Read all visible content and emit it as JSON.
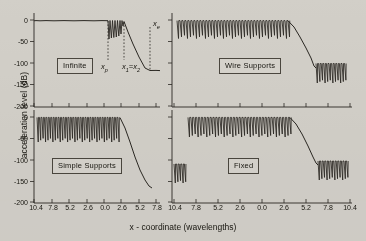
{
  "figure": {
    "xlabel": "x - coordinate (wavelengths)",
    "ylabel": "acceleration level (dB)"
  },
  "axes": {
    "ytick_labels": [
      "0",
      "-50",
      "-100",
      "-150",
      "-200"
    ],
    "ytick_values": [
      0,
      -50,
      -100,
      -150,
      -200
    ],
    "xtick_labels_left": [
      "10.4",
      "7.8",
      "5.2",
      "2.6",
      "0.0",
      "2.6",
      "5.2",
      "7.8"
    ],
    "xtick_labels_right": [
      "10.4",
      "7.8",
      "5.2",
      "2.6",
      "0.0",
      "2.6",
      "5.2",
      "7.8",
      "10.4"
    ],
    "xtick_values": [
      -10.4,
      -7.8,
      -5.2,
      -2.6,
      0.0,
      2.6,
      5.2,
      7.8,
      10.4
    ]
  },
  "panels": {
    "top_left": {
      "label": "Infinite"
    },
    "top_right": {
      "label": "Wire Supports"
    },
    "bottom_left": {
      "label": "Simple Supports"
    },
    "bottom_right": {
      "label": "Fixed"
    }
  },
  "annotations": {
    "xp": {
      "base": "x",
      "sub": "p"
    },
    "x1x2": {
      "base": "x",
      "sub": "1",
      "eq": "=",
      "base2": "x",
      "sub2": "2"
    },
    "xe": {
      "base": "x",
      "sub": "e"
    }
  },
  "chart_data": {
    "type": "line",
    "title": "",
    "xlabel": "x - coordinate (wavelengths)",
    "ylabel": "acceleration level (dB)",
    "xlim": [
      -11.7,
      11.7
    ],
    "ylim": [
      -210,
      10
    ],
    "grid": false,
    "legend": "none",
    "panel_layout": "2x2",
    "panels": [
      {
        "name": "Infinite",
        "position": "top-left",
        "description": "Flat plateau near 0 dB from x=-11.7 to x=1.6; short burst of narrow oscillation spikes between x=1.6 and x=3.0 reaching down to about -45 dB; steep linear roll-off from 0 dB at x=3.0 to -115 dB at x=5.5; flat tail at about -115 dB out to x=11.7.",
        "plateau_level_db": -2,
        "rolloff_start_x": 3.0,
        "rolloff_end_x": 5.5,
        "tail_level_db": -115,
        "annotations": [
          {
            "label": "x_p",
            "x": 1.6,
            "type": "vertical-dashed"
          },
          {
            "label": "x_1=x_2",
            "x": 3.0,
            "type": "vertical-dotted"
          },
          {
            "label": "x_e",
            "x": 5.5,
            "type": "vertical-dashed"
          }
        ]
      },
      {
        "name": "Wire Supports",
        "position": "top-right",
        "description": "Dense periodic spike train between 0 and about -40 dB across x=-10.6 to x=2.6; steep roll-off from x=2.6 to x=5.2 down to about -105 dB; second dense spike train between -100 and -160 dB from x=5.2 to x=11.0.",
        "upper_train_range_db": [
          -40,
          0
        ],
        "upper_train_x": [
          -10.6,
          2.6
        ],
        "rolloff_x": [
          2.6,
          5.2
        ],
        "lower_train_range_db": [
          -160,
          -100
        ],
        "lower_train_x": [
          5.2,
          11.0
        ]
      },
      {
        "name": "Simple Supports",
        "position": "bottom-left",
        "description": "Dense periodic spike train between 0 and about -60 dB across x=-11.0 to x=2.6; steep roll-off from x=2.6 to x=5.6 down to about -150 dB; sparse low-level residual near -150 to -175 dB beyond x=5.6.",
        "upper_train_range_db": [
          -60,
          0
        ],
        "upper_train_x": [
          -11.0,
          2.6
        ],
        "rolloff_x": [
          2.6,
          5.6
        ],
        "tail_level_db": -155
      },
      {
        "name": "Fixed",
        "position": "bottom-right",
        "description": "Short spike train at left edge between -110 and -150 dB; dense periodic spike train between 0 and about -45 dB from x=-10.0 to x=2.6; steep roll-off from x=2.6 to x=5.3 down to about -105 dB; dense spike train between -100 and -150 dB from x=5.3 to x=11.2.",
        "upper_train_range_db": [
          -45,
          0
        ],
        "upper_train_x": [
          -10.0,
          2.6
        ],
        "rolloff_x": [
          2.6,
          5.3
        ],
        "lower_train_range_db": [
          -150,
          -100
        ],
        "lower_train_x": [
          5.3,
          11.2
        ]
      }
    ]
  }
}
